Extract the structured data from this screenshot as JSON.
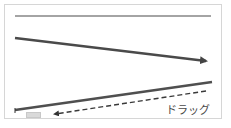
{
  "diagram": {
    "label": "ドラッグ",
    "colors": {
      "frame_border": "#d6d6d6",
      "line": "#4a4a4a",
      "dashed": "#3a3a3a",
      "chip": "#d9d9d9"
    },
    "elements": [
      {
        "type": "line",
        "from": [
          15,
          16
        ],
        "to": [
          211,
          16
        ],
        "width": 1.2
      },
      {
        "type": "arrow",
        "from": [
          15,
          38
        ],
        "to": [
          213,
          62
        ],
        "width": 2.6
      },
      {
        "type": "line",
        "from": [
          15,
          110
        ],
        "to": [
          212,
          82
        ],
        "width": 2.6
      },
      {
        "type": "dashed-arrow",
        "from": [
          206,
          91
        ],
        "to": [
          50,
          115
        ],
        "width": 1.4
      }
    ]
  }
}
